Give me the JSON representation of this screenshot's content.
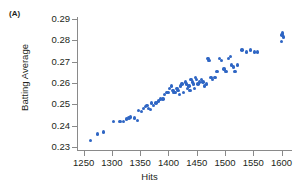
{
  "figure": {
    "panel_label": "(A)"
  },
  "chart_data": {
    "type": "scatter",
    "title": "",
    "xlabel": "Hits",
    "ylabel": "Batting Average",
    "xlim": [
      1240,
      1615
    ],
    "ylim": [
      0.2285,
      0.2905
    ],
    "grid": false,
    "legend": null,
    "marker_color": "#2f66c4",
    "axis_color": "#8a8a8a",
    "xticks": [
      1250,
      1300,
      1350,
      1400,
      1450,
      1500,
      1550,
      1600
    ],
    "xtick_labels": [
      "1250",
      "1300",
      "1350",
      "1400",
      "1450",
      "1500",
      "1550",
      "1600"
    ],
    "yticks": [
      0.23,
      0.24,
      0.25,
      0.26,
      0.27,
      0.28,
      0.29
    ],
    "ytick_labels": [
      "0.23",
      "0.24",
      "0.25",
      "0.26",
      "0.27",
      "0.28",
      "0.29"
    ],
    "x": [
      1262,
      1275,
      1285,
      1303,
      1314,
      1320,
      1326,
      1330,
      1333,
      1340,
      1345,
      1347,
      1352,
      1356,
      1359,
      1362,
      1365,
      1368,
      1370,
      1374,
      1378,
      1382,
      1386,
      1390,
      1393,
      1396,
      1399,
      1402,
      1405,
      1408,
      1410,
      1412,
      1415,
      1417,
      1419,
      1421,
      1424,
      1427,
      1430,
      1432,
      1434,
      1436,
      1438,
      1440,
      1442,
      1444,
      1446,
      1448,
      1450,
      1452,
      1455,
      1458,
      1461,
      1464,
      1467,
      1470,
      1472,
      1475,
      1478,
      1482,
      1486,
      1490,
      1494,
      1498,
      1502,
      1506,
      1510,
      1512,
      1515,
      1518,
      1522,
      1530,
      1538,
      1545,
      1552,
      1558,
      1600,
      1601,
      1602,
      1603
    ],
    "y": [
      0.233,
      0.236,
      0.237,
      0.242,
      0.242,
      0.242,
      0.243,
      0.2435,
      0.244,
      0.2435,
      0.2425,
      0.247,
      0.2465,
      0.248,
      0.249,
      0.2495,
      0.248,
      0.2475,
      0.2505,
      0.2495,
      0.2505,
      0.2515,
      0.2525,
      0.2525,
      0.2545,
      0.2555,
      0.2555,
      0.2575,
      0.2585,
      0.2565,
      0.2555,
      0.2555,
      0.2575,
      0.2565,
      0.2545,
      0.2585,
      0.2595,
      0.2555,
      0.2605,
      0.2595,
      0.2575,
      0.2585,
      0.2565,
      0.2615,
      0.2605,
      0.2595,
      0.2575,
      0.2625,
      0.2615,
      0.2595,
      0.2605,
      0.2615,
      0.2605,
      0.2585,
      0.2595,
      0.2715,
      0.2705,
      0.2625,
      0.2615,
      0.2625,
      0.2655,
      0.2715,
      0.2705,
      0.2665,
      0.2655,
      0.2715,
      0.2725,
      0.2685,
      0.2675,
      0.2655,
      0.2685,
      0.2755,
      0.2745,
      0.2755,
      0.2745,
      0.2745,
      0.2795,
      0.2825,
      0.2835,
      0.2815
    ]
  }
}
